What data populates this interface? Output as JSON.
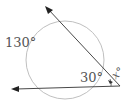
{
  "diagram": {
    "type": "geometry-circle-secants",
    "labels": {
      "arc_far": "130°",
      "arc_near": "30°",
      "angle": "x°"
    },
    "colors": {
      "circle": "#b8b8b8",
      "lines": "#333333",
      "text": "#555555"
    }
  }
}
